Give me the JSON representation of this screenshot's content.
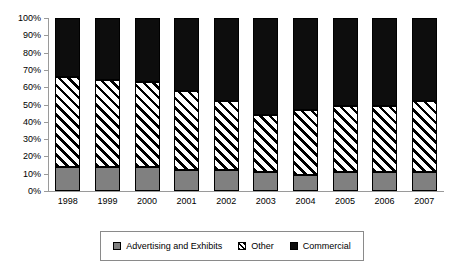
{
  "chart_data": {
    "type": "bar",
    "stacked": true,
    "stack_mode": "percent",
    "title": "",
    "subtitle": "",
    "xlabel": "",
    "ylabel": "",
    "ylim": [
      0,
      100
    ],
    "grid": false,
    "legend_position": "bottom",
    "categories": [
      "1998",
      "1999",
      "2000",
      "2001",
      "2002",
      "2003",
      "2004",
      "2005",
      "2006",
      "2007"
    ],
    "y_ticks": [
      "0%",
      "10%",
      "20%",
      "30%",
      "40%",
      "50%",
      "60%",
      "70%",
      "80%",
      "90%",
      "100%"
    ],
    "y_tick_values": [
      0,
      10,
      20,
      30,
      40,
      50,
      60,
      70,
      80,
      90,
      100
    ],
    "series": [
      {
        "name": "Advertising and Exhibits",
        "color": "#808080",
        "pattern": "solid",
        "values": [
          14,
          14,
          14,
          12,
          12,
          11,
          9.5,
          11,
          11,
          11
        ]
      },
      {
        "name": "Other",
        "color": "#ffffff",
        "pattern": "diagonal-hatch",
        "values": [
          52,
          50,
          49,
          46,
          40,
          33,
          37.5,
          38,
          38,
          41
        ]
      },
      {
        "name": "Commercial",
        "color": "#0d0d0d",
        "pattern": "solid",
        "values": [
          34,
          36,
          37,
          42,
          48,
          56,
          53,
          51,
          51,
          48
        ]
      }
    ],
    "cumulative_tops": {
      "advertising_and_exhibits": [
        14,
        14,
        14,
        12,
        12,
        11,
        9.5,
        11,
        11,
        11
      ],
      "other": [
        66,
        64,
        63,
        58,
        52,
        44,
        47,
        49,
        49,
        52
      ],
      "commercial": [
        100,
        100,
        100,
        100,
        100,
        100,
        100,
        100,
        100,
        100
      ]
    }
  },
  "legend": {
    "items": [
      {
        "label": "Advertising and Exhibits",
        "swatch": "advertising"
      },
      {
        "label": "Other",
        "swatch": "other"
      },
      {
        "label": "Commercial",
        "swatch": "commercial"
      }
    ]
  }
}
